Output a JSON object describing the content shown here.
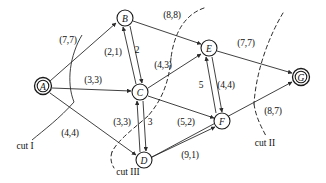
{
  "figure": {
    "type": "flow-network-diagram",
    "width": 326,
    "height": 183,
    "ink_color": "#2b2b2b"
  },
  "nodes": [
    {
      "id": "A",
      "label": "A",
      "x": 43,
      "y": 86,
      "double": true,
      "r": 8.5
    },
    {
      "id": "B",
      "label": "B",
      "x": 125,
      "y": 18,
      "double": false,
      "r": 8.0
    },
    {
      "id": "C",
      "label": "C",
      "x": 140,
      "y": 92,
      "double": false,
      "r": 8.0
    },
    {
      "id": "D",
      "label": "D",
      "x": 144,
      "y": 160,
      "double": false,
      "r": 8.0
    },
    {
      "id": "E",
      "label": "E",
      "x": 209,
      "y": 48,
      "double": false,
      "r": 8.0
    },
    {
      "id": "F",
      "label": "F",
      "x": 222,
      "y": 121,
      "double": false,
      "r": 8.0
    },
    {
      "id": "G",
      "label": "G",
      "x": 301,
      "y": 77,
      "double": true,
      "r": 8.5
    }
  ],
  "edges": [
    {
      "from": "A",
      "to": "B",
      "label": "(7,7)",
      "label_x": 68,
      "label_y": 40
    },
    {
      "from": "A",
      "to": "C",
      "label": "(3,3)",
      "label_x": 93,
      "label_y": 80
    },
    {
      "from": "A",
      "to": "D",
      "label": "(4,4)",
      "label_x": 70,
      "label_y": 133
    },
    {
      "from": "B",
      "to": "E",
      "label": "(8,8)",
      "label_x": 172,
      "label_y": 15
    },
    {
      "from": "C",
      "to": "B",
      "label": "(2,1)",
      "label_x": 113,
      "label_y": 52
    },
    {
      "from": "B",
      "to": "C",
      "label": "2",
      "label_x": 137,
      "label_y": 50
    },
    {
      "from": "C",
      "to": "E",
      "label": "(4,3)",
      "label_x": 163,
      "label_y": 65
    },
    {
      "from": "E",
      "to": "G",
      "label": "(7,7)",
      "label_x": 246,
      "label_y": 43
    },
    {
      "from": "F",
      "to": "E",
      "label": "5",
      "label_x": 201,
      "label_y": 85
    },
    {
      "from": "E",
      "to": "F",
      "label": "(4,4)",
      "label_x": 226,
      "label_y": 85
    },
    {
      "from": "D",
      "to": "C",
      "label": "(3,3)",
      "label_x": 122,
      "label_y": 122
    },
    {
      "from": "C",
      "to": "D",
      "label": "3",
      "label_x": 150,
      "label_y": 122
    },
    {
      "from": "C",
      "to": "F",
      "label": "(5,2)",
      "label_x": 186,
      "label_y": 122
    },
    {
      "from": "D",
      "to": "G",
      "label": "(8,7)",
      "label_x": 273,
      "label_y": 111
    },
    {
      "from": "D",
      "to": "F",
      "label": "(9,1)",
      "label_x": 190,
      "label_y": 155
    }
  ],
  "cuts": [
    {
      "id": "cut-1",
      "label": "cut I",
      "label_x": 25,
      "label_y": 146
    },
    {
      "id": "cut-2",
      "label": "cut II",
      "label_x": 265,
      "label_y": 143
    },
    {
      "id": "cut-3",
      "label": "cut III",
      "label_x": 128,
      "label_y": 172
    }
  ]
}
